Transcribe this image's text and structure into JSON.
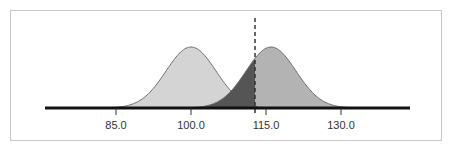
{
  "chart_data": {
    "type": "area",
    "title": "",
    "xlabel": "",
    "ylabel": "",
    "x_ticks": [
      85.0,
      100.0,
      115.0,
      130.0
    ],
    "tick_labels": [
      "85.0",
      "100.0",
      "115.0",
      "130.0"
    ],
    "xlim": [
      76,
      143
    ],
    "grid": false,
    "legend": null,
    "series": [
      {
        "name": "left-distribution",
        "type": "normal",
        "mean": 100.0,
        "sd": 5.0,
        "fill": "#d4d4d4"
      },
      {
        "name": "right-distribution",
        "type": "normal",
        "mean": 116.0,
        "sd": 5.0,
        "fill": "#b3b3b3"
      }
    ],
    "cutoff": {
      "x": 112.8,
      "style": "dashed"
    },
    "shaded_regions": [
      {
        "name": "right-distribution-left-of-cutoff",
        "fill": "#555555"
      },
      {
        "name": "left-distribution-right-of-cutoff",
        "fill": "hatched"
      }
    ]
  },
  "axis": {
    "labels": [
      "85.0",
      "100.0",
      "115.0",
      "130.0"
    ]
  },
  "colors": {
    "left_fill": "#d4d4d4",
    "right_fill": "#b3b3b3",
    "overlap_dark": "#555555",
    "curve_stroke": "#6e6e6e",
    "axis": "#111111",
    "frame": "#c8c8c8"
  }
}
